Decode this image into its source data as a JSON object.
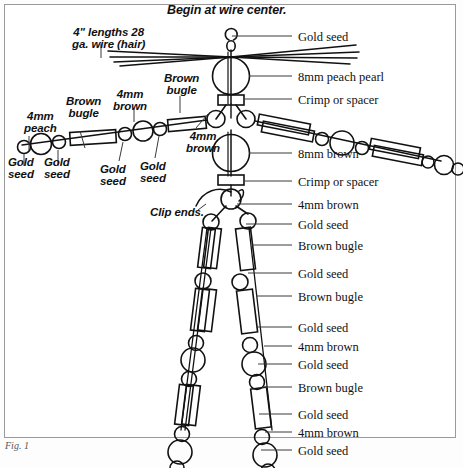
{
  "figure": {
    "title": "Begin at wire center.",
    "caption": "Fig. 1",
    "type": "beaded-wire-figure-diagram"
  },
  "annotations_left": [
    {
      "id": "hair-wire",
      "text": "4\" lengths 28\nga. wire (hair)",
      "x": 72,
      "y": 26
    },
    {
      "id": "4mm-peach",
      "text": "4mm\npeach",
      "x": 24,
      "y": 110
    },
    {
      "id": "brown-bugle-left",
      "text": "Brown\nbugle",
      "x": 66,
      "y": 95
    },
    {
      "id": "4mm-brown-upper",
      "text": "4mm\nbrown",
      "x": 113,
      "y": 88
    },
    {
      "id": "brown-bugle-left2",
      "text": "Brown\nbugle",
      "x": 164,
      "y": 72
    },
    {
      "id": "gold-seed-l1",
      "text": "Gold\nseed",
      "x": 8,
      "y": 156
    },
    {
      "id": "gold-seed-l2",
      "text": "Gold\nseed",
      "x": 44,
      "y": 156
    },
    {
      "id": "gold-seed-l3",
      "text": "Gold\nseed",
      "x": 100,
      "y": 163
    },
    {
      "id": "gold-seed-l4",
      "text": "Gold\nseed",
      "x": 140,
      "y": 160
    },
    {
      "id": "4mm-brown-inner",
      "text": "4mm\nbrown",
      "x": 186,
      "y": 130
    },
    {
      "id": "clip-ends",
      "text": "Clip ends.",
      "x": 150,
      "y": 206
    }
  ],
  "annotations_right": [
    {
      "id": "gold-seed-top",
      "text": "Gold seed",
      "x": 298,
      "y": 31,
      "leader_from": 232,
      "leader_to": 292,
      "leader_y": 36
    },
    {
      "id": "8mm-peach-pearl",
      "text": "8mm peach pearl",
      "x": 298,
      "y": 71,
      "leader_from": 249,
      "leader_to": 292,
      "leader_y": 76
    },
    {
      "id": "crimp-spacer-1",
      "text": "Crimp or spacer",
      "x": 298,
      "y": 94,
      "leader_from": 243,
      "leader_to": 292,
      "leader_y": 99
    },
    {
      "id": "8mm-brown",
      "text": "8mm brown",
      "x": 298,
      "y": 148,
      "leader_from": 249,
      "leader_to": 292,
      "leader_y": 153
    },
    {
      "id": "crimp-spacer-2",
      "text": "Crimp or spacer",
      "x": 298,
      "y": 176,
      "leader_from": 243,
      "leader_to": 292,
      "leader_y": 181
    },
    {
      "id": "4mm-brown-r1",
      "text": "4mm brown",
      "x": 298,
      "y": 199,
      "leader_from": 237,
      "leader_to": 292,
      "leader_y": 204
    },
    {
      "id": "gold-seed-r1",
      "text": "Gold seed",
      "x": 298,
      "y": 219,
      "leader_from": 246,
      "leader_to": 292,
      "leader_y": 224
    },
    {
      "id": "brown-bugle-r1",
      "text": "Brown bugle",
      "x": 298,
      "y": 240,
      "leader_from": 252,
      "leader_to": 292,
      "leader_y": 245
    },
    {
      "id": "gold-seed-r2",
      "text": "Gold seed",
      "x": 298,
      "y": 268,
      "leader_from": 248,
      "leader_to": 292,
      "leader_y": 273
    },
    {
      "id": "brown-bugle-r2",
      "text": "Brown bugle",
      "x": 298,
      "y": 291,
      "leader_from": 256,
      "leader_to": 292,
      "leader_y": 296
    },
    {
      "id": "gold-seed-r3",
      "text": "Gold seed",
      "x": 298,
      "y": 322,
      "leader_from": 256,
      "leader_to": 292,
      "leader_y": 327
    },
    {
      "id": "4mm-brown-r2",
      "text": "4mm brown",
      "x": 298,
      "y": 341,
      "leader_from": 264,
      "leader_to": 292,
      "leader_y": 346
    },
    {
      "id": "gold-seed-r4",
      "text": "Gold seed",
      "x": 298,
      "y": 359,
      "leader_from": 258,
      "leader_to": 292,
      "leader_y": 364
    },
    {
      "id": "brown-bugle-r3",
      "text": "Brown bugle",
      "x": 298,
      "y": 382,
      "leader_from": 262,
      "leader_to": 292,
      "leader_y": 387
    },
    {
      "id": "gold-seed-r5",
      "text": "Gold seed",
      "x": 298,
      "y": 409,
      "leader_from": 259,
      "leader_to": 292,
      "leader_y": 414
    },
    {
      "id": "4mm-brown-r3",
      "text": "4mm brown",
      "x": 298,
      "y": 427,
      "leader_from": 265,
      "leader_to": 292,
      "leader_y": 432
    },
    {
      "id": "gold-seed-r6",
      "text": "Gold seed",
      "x": 298,
      "y": 445,
      "leader_from": 261,
      "leader_to": 292,
      "leader_y": 450
    }
  ],
  "colors": {
    "ink": "#111111",
    "leader": "#4a4a4a",
    "border": "#9a9a9a",
    "page": "#ffffff"
  }
}
